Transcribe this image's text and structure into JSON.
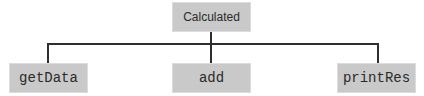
{
  "diagram": {
    "type": "tree",
    "root": {
      "label": "Calculated"
    },
    "children": [
      {
        "label": "getData"
      },
      {
        "label": "add"
      },
      {
        "label": "printRes"
      }
    ],
    "colors": {
      "node_fill": "#c9c9c9",
      "connector": "#2e2e2e",
      "text": "#2a2a2a",
      "background": "#ffffff"
    }
  }
}
